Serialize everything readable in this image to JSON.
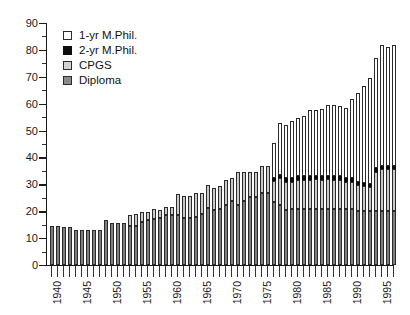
{
  "chart_data": {
    "type": "bar",
    "subtype": "stacked",
    "title": "",
    "xlabel": "",
    "ylabel": "",
    "ylim": [
      0,
      90
    ],
    "y_major_ticks": [
      0,
      10,
      20,
      30,
      40,
      50,
      60,
      70,
      80,
      90
    ],
    "y_minor_tick_interval": 5,
    "grid": false,
    "legend_position": "top-left",
    "x_tick_labels": [
      "1940",
      "1945",
      "1950",
      "1955",
      "1960",
      "1965",
      "1970",
      "1975",
      "1980",
      "1985",
      "1990",
      "1995"
    ],
    "categories": [
      1939,
      1940,
      1941,
      1942,
      1943,
      1944,
      1945,
      1946,
      1947,
      1948,
      1949,
      1950,
      1951,
      1952,
      1953,
      1954,
      1955,
      1956,
      1957,
      1958,
      1959,
      1960,
      1961,
      1962,
      1963,
      1964,
      1965,
      1966,
      1967,
      1968,
      1969,
      1970,
      1971,
      1972,
      1973,
      1974,
      1975,
      1976,
      1977,
      1978,
      1979,
      1980,
      1981,
      1982,
      1983,
      1984,
      1985,
      1986,
      1987,
      1988,
      1989,
      1990,
      1991,
      1992,
      1993,
      1994,
      1995,
      1996
    ],
    "series": [
      {
        "name": "Diploma",
        "color": "#7f7f7f",
        "values": [
          14.5,
          14.5,
          14,
          14,
          13,
          13,
          13,
          13,
          13,
          16.7,
          15.5,
          15.5,
          15.5,
          14.5,
          14.5,
          16,
          16.7,
          17,
          17.5,
          18.7,
          18.7,
          18.7,
          17.5,
          17.5,
          18,
          19,
          21.3,
          20.5,
          21,
          22.3,
          23.7,
          22.3,
          23.7,
          25.3,
          25.3,
          26.7,
          26.7,
          23.3,
          22.3,
          20.5,
          21,
          21,
          21,
          21,
          21,
          21,
          21,
          21,
          21,
          21,
          21,
          20.2,
          20.2,
          20.2,
          20.2,
          20.2,
          20.2,
          20.2
        ]
      },
      {
        "name": "CPGS",
        "color": "#c9c9c9",
        "values": [
          0,
          0,
          0,
          0,
          0,
          0,
          0,
          0,
          0,
          0,
          0,
          0,
          0,
          4,
          4.3,
          3.7,
          3,
          3.7,
          3,
          2.7,
          2.7,
          7.8,
          8,
          8,
          8.7,
          7.7,
          8.3,
          8,
          8.5,
          9.2,
          8.8,
          12.2,
          10.8,
          9.2,
          9.3,
          10,
          10,
          8,
          10,
          10.5,
          10,
          10.8,
          10.8,
          10.8,
          11,
          10.8,
          11,
          10.8,
          10.8,
          10,
          10,
          9.6,
          9.2,
          8.8,
          14.5,
          15.5,
          15.5,
          15.5
        ]
      },
      {
        "name": "2-yr M.Phil.",
        "color": "#0d0d0d",
        "values": [
          0,
          0,
          0,
          0,
          0,
          0,
          0,
          0,
          0,
          0,
          0,
          0,
          0,
          0,
          0,
          0,
          0,
          0,
          0,
          0,
          0,
          0,
          0,
          0,
          0,
          0,
          0,
          0,
          0,
          0,
          0,
          0,
          0,
          0,
          0,
          0,
          0,
          1.2,
          1.2,
          1.2,
          1.2,
          1.2,
          1.2,
          1.2,
          1.2,
          1.2,
          1.2,
          1.2,
          1.2,
          1.2,
          1.2,
          1.2,
          1.2,
          1.2,
          1.2,
          1.2,
          1.2,
          1.2
        ]
      },
      {
        "name": "1-yr M.Phil.",
        "color": "#ffffff",
        "values": [
          0,
          0,
          0,
          0,
          0,
          0,
          0,
          0,
          0,
          0,
          0,
          0,
          0,
          0,
          0,
          0,
          0,
          0,
          0,
          0,
          0,
          0,
          0,
          0,
          0,
          0,
          0,
          0,
          0,
          0,
          0,
          0,
          0,
          0,
          0,
          0,
          0,
          13,
          19.3,
          19.8,
          21.3,
          21.5,
          22.3,
          24.5,
          24.5,
          25,
          26.3,
          26.5,
          26.3,
          26.3,
          29.5,
          33,
          35.8,
          39.3,
          41.1,
          45,
          44.1,
          45.1
        ]
      }
    ],
    "totals": [
      14.5,
      14.5,
      14,
      14,
      13,
      13,
      13,
      13,
      13,
      16.7,
      15.5,
      15.5,
      15.5,
      18.5,
      18.8,
      19.7,
      19.7,
      20.7,
      20.5,
      21.4,
      21.4,
      26.5,
      25.5,
      25.5,
      26.7,
      26.7,
      29.6,
      28.5,
      29.5,
      31.5,
      32.5,
      34.5,
      34.5,
      34.5,
      34.6,
      36.7,
      36.7,
      45.5,
      52.8,
      51.5,
      53.5,
      54.5,
      55.3,
      57.5,
      57.7,
      58,
      59.5,
      59.5,
      59.3,
      58.5,
      61.7,
      64,
      66.4,
      69.5,
      77,
      81.9,
      81,
      82
    ]
  },
  "legend": {
    "entries": [
      {
        "label": "1-yr M.Phil.",
        "swatch": "white"
      },
      {
        "label": "2-yr M.Phil.",
        "swatch": "black"
      },
      {
        "label": "CPGS",
        "swatch": "light-gray"
      },
      {
        "label": "Diploma",
        "swatch": "dark-gray"
      }
    ]
  },
  "y_axis": {
    "labels": [
      "0",
      "10",
      "20",
      "30",
      "40",
      "50",
      "60",
      "70",
      "80",
      "90"
    ]
  }
}
